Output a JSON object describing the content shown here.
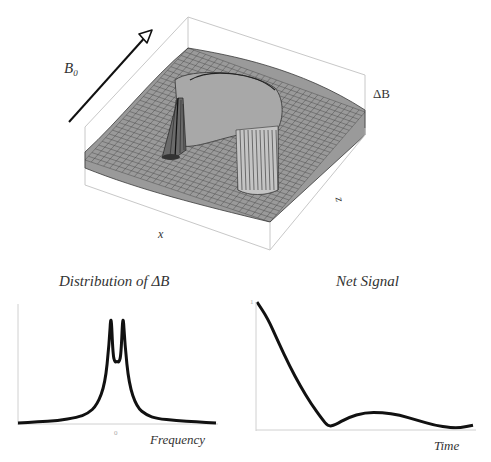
{
  "surface_plot": {
    "field_label_symbol": "B",
    "field_label_subscript": "0",
    "vertical_axis_label": "ΔB",
    "x_axis_label": "x",
    "z_axis_label": "z",
    "colors": {
      "mesh_fill": "#9a9a9a",
      "mesh_line": "#2a2a2a",
      "box": "#c8c8c8",
      "arrow": "#111111"
    }
  },
  "chart_data": [
    {
      "type": "line",
      "title": "Distribution of ΔB",
      "xlabel": "Frequency",
      "ylabel": "",
      "x_tick_labels": [
        "0"
      ],
      "grid": false,
      "legend": null,
      "description": "Symmetric double-peaked (Lorentzian-like) distribution with two sharp peaks around zero frequency and a dip between them",
      "x": [
        -1.0,
        -0.8,
        -0.6,
        -0.4,
        -0.3,
        -0.2,
        -0.12,
        -0.08,
        -0.06,
        -0.04,
        -0.02,
        0.0,
        0.02,
        0.04,
        0.06,
        0.08,
        0.12,
        0.2,
        0.3,
        0.4,
        0.6,
        0.8,
        1.0
      ],
      "y": [
        0.0,
        0.01,
        0.02,
        0.05,
        0.08,
        0.16,
        0.35,
        0.7,
        1.0,
        0.6,
        0.54,
        0.55,
        0.54,
        0.6,
        1.0,
        0.7,
        0.35,
        0.14,
        0.07,
        0.04,
        0.02,
        0.01,
        0.0
      ],
      "ylim": [
        0,
        1.05
      ]
    },
    {
      "type": "line",
      "title": "Net Signal",
      "xlabel": "Time",
      "ylabel": "",
      "y_tick_labels": [
        "1"
      ],
      "grid": false,
      "legend": null,
      "description": "Signal decays from 1 to near zero, then shows a small damped oscillation (beat)",
      "x": [
        0.0,
        0.05,
        0.1,
        0.15,
        0.2,
        0.25,
        0.3,
        0.33,
        0.36,
        0.42,
        0.5,
        0.58,
        0.66,
        0.74,
        0.82,
        0.9,
        0.94,
        1.0
      ],
      "y": [
        1.0,
        0.87,
        0.68,
        0.5,
        0.34,
        0.2,
        0.08,
        0.02,
        0.03,
        0.09,
        0.13,
        0.13,
        0.11,
        0.07,
        0.03,
        0.01,
        0.01,
        0.03
      ],
      "ylim": [
        0,
        1.0
      ]
    }
  ]
}
